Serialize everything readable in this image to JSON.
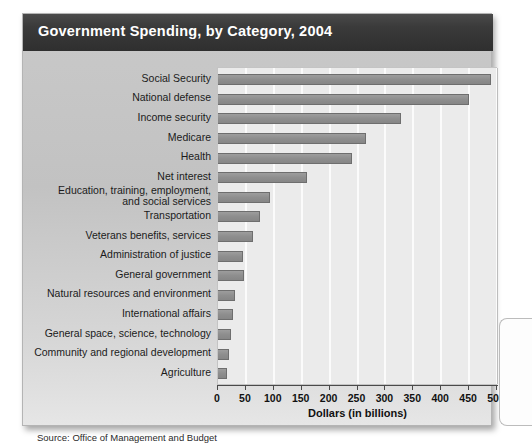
{
  "figure": {
    "title": "Government Spending, by Category, 2004",
    "source_note": "Source: Office of Management and Budget"
  },
  "colors": {
    "title_bar": "#3a3a3a",
    "title_text": "#ffffff",
    "panel_background": "#c6c6c6",
    "plot_background": "#ebebeb",
    "gridline": "#fbfbfb",
    "bar_fill": "#8e8e8e",
    "bar_border": "#6e6e6e",
    "axis": "#4a4a4a",
    "label_text": "#1b1b1b"
  },
  "chart_data": {
    "type": "bar",
    "orientation": "horizontal",
    "title": "Government Spending, by Category, 2004",
    "xlabel": "Dollars (in billions)",
    "ylabel": "",
    "xlim": [
      0,
      500
    ],
    "xticks": [
      0,
      50,
      100,
      150,
      200,
      250,
      300,
      350,
      400,
      450,
      500
    ],
    "xtick_labels": [
      "0",
      "50",
      "100",
      "150",
      "200",
      "250",
      "300",
      "350",
      "400",
      "450",
      "500"
    ],
    "grid": "vertical",
    "legend": "none",
    "categories": [
      "Social Security",
      "National defense",
      "Income security",
      "Medicare",
      "Health",
      "Net interest",
      "Education, training, employment, and social services",
      "Transportation",
      "Veterans benefits, services",
      "Administration of justice",
      "General government",
      "Natural resources and environment",
      "International affairs",
      "General space,  science, technology",
      "Community and regional development",
      "Agriculture"
    ],
    "values": [
      490,
      450,
      328,
      266,
      240,
      160,
      93,
      75,
      62,
      44,
      46,
      31,
      27,
      23,
      20,
      17
    ],
    "units": "billions of dollars",
    "source": "Office of Management and Budget"
  },
  "axis": {
    "title": "Dollars (in billions)"
  },
  "categories": [
    {
      "label": "Social Security",
      "value": 490,
      "lines": [
        "Social Security"
      ]
    },
    {
      "label": "National defense",
      "value": 450,
      "lines": [
        "National defense"
      ]
    },
    {
      "label": "Income security",
      "value": 328,
      "lines": [
        "Income security"
      ]
    },
    {
      "label": "Medicare",
      "value": 266,
      "lines": [
        "Medicare"
      ]
    },
    {
      "label": "Health",
      "value": 240,
      "lines": [
        "Health"
      ]
    },
    {
      "label": "Net interest",
      "value": 160,
      "lines": [
        "Net interest"
      ]
    },
    {
      "label": "Education, training, employment, and social services",
      "value": 93,
      "lines": [
        "Education, training, employment,",
        "and social services"
      ]
    },
    {
      "label": "Transportation",
      "value": 75,
      "lines": [
        "Transportation"
      ]
    },
    {
      "label": "Veterans benefits, services",
      "value": 62,
      "lines": [
        "Veterans benefits, services"
      ]
    },
    {
      "label": "Administration of justice",
      "value": 44,
      "lines": [
        "Administration of justice"
      ]
    },
    {
      "label": "General government",
      "value": 46,
      "lines": [
        "General government"
      ]
    },
    {
      "label": "Natural resources and environment",
      "value": 31,
      "lines": [
        "Natural resources and environment"
      ]
    },
    {
      "label": "International affairs",
      "value": 27,
      "lines": [
        "International affairs"
      ]
    },
    {
      "label": "General space,  science, technology",
      "value": 23,
      "lines": [
        "General space,  science, technology"
      ]
    },
    {
      "label": "Community and regional development",
      "value": 20,
      "lines": [
        "Community and regional development"
      ]
    },
    {
      "label": "Agriculture",
      "value": 17,
      "lines": [
        "Agriculture"
      ]
    }
  ]
}
